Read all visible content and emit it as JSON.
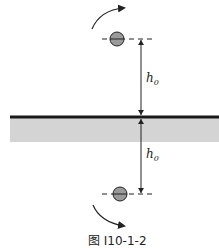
{
  "diagram": {
    "labels": {
      "upper_distance": "h",
      "upper_distance_sub": "0",
      "lower_distance": "h",
      "lower_distance_sub": "0"
    },
    "caption": "图 I10-1-2",
    "colors": {
      "surface_line": "#1a1a1a",
      "shaded_region": "#d4d4d4",
      "sphere_fill": "#9a9a9a",
      "stroke": "#222222"
    },
    "elements": [
      {
        "type": "charge",
        "position": "above surface",
        "label": "real sphere"
      },
      {
        "type": "charge",
        "position": "below surface",
        "label": "image sphere"
      },
      {
        "type": "rotation-arrow",
        "direction": "clockwise",
        "position": "top"
      },
      {
        "type": "rotation-arrow",
        "direction": "counter-clockwise",
        "position": "bottom"
      }
    ]
  }
}
